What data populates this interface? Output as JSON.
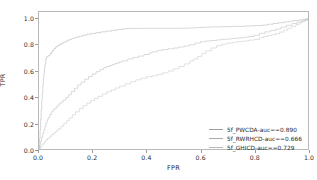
{
  "chart_data": {
    "type": "line",
    "title": "",
    "xlabel": "FPR",
    "ylabel": "TPR",
    "xlim": [
      0.0,
      1.0
    ],
    "ylim": [
      0.0,
      1.05
    ],
    "grid": false,
    "legend_position": "lower right",
    "xticks": [
      "0.0",
      "0.2",
      "0.4",
      "0.6",
      "0.8",
      "1.0"
    ],
    "xtick_values": [
      0.0,
      0.2,
      0.4,
      0.6,
      0.8,
      1.0
    ],
    "yticks": [
      "0.0",
      "0.2",
      "0.4",
      "0.6",
      "0.8",
      "1.0"
    ],
    "ytick_values": [
      0.0,
      0.2,
      0.4,
      0.6,
      0.8,
      1.0
    ],
    "series": [
      {
        "name": "5f_PWCDA-auc==0.890",
        "label": "5f_PWCDA-auc==0.890",
        "auc": 0.89,
        "color": "#9aa0a6",
        "x": [
          0.0,
          0.002,
          0.004,
          0.006,
          0.008,
          0.01,
          0.012,
          0.014,
          0.016,
          0.018,
          0.02,
          0.022,
          0.025,
          0.028,
          0.03,
          0.034,
          0.038,
          0.042,
          0.046,
          0.05,
          0.056,
          0.062,
          0.068,
          0.074,
          0.082,
          0.09,
          0.1,
          0.11,
          0.122,
          0.134,
          0.148,
          0.162,
          0.178,
          0.194,
          0.212,
          0.23,
          0.25,
          0.27,
          0.29,
          0.31,
          0.33,
          0.38,
          0.43,
          0.48,
          0.53,
          0.56,
          0.58,
          0.6,
          0.62,
          0.64,
          0.68,
          0.72,
          0.76,
          0.8,
          0.83,
          0.85,
          0.87,
          0.89,
          0.91,
          0.93,
          0.945,
          0.96,
          0.972,
          0.982,
          0.99,
          0.996,
          1.0
        ],
        "y": [
          0.01,
          0.08,
          0.15,
          0.23,
          0.3,
          0.37,
          0.43,
          0.49,
          0.54,
          0.58,
          0.62,
          0.65,
          0.69,
          0.705,
          0.71,
          0.714,
          0.72,
          0.73,
          0.742,
          0.755,
          0.77,
          0.782,
          0.792,
          0.8,
          0.81,
          0.818,
          0.828,
          0.838,
          0.848,
          0.856,
          0.864,
          0.872,
          0.88,
          0.886,
          0.892,
          0.898,
          0.904,
          0.91,
          0.916,
          0.921,
          0.924,
          0.925,
          0.925,
          0.925,
          0.926,
          0.928,
          0.93,
          0.932,
          0.934,
          0.936,
          0.938,
          0.94,
          0.943,
          0.946,
          0.95,
          0.956,
          0.962,
          0.968,
          0.974,
          0.98,
          0.984,
          0.988,
          0.991,
          0.994,
          0.996,
          0.998,
          1.0
        ]
      },
      {
        "name": "5f_RWRHCD-auc==0.666",
        "label": "5f_RWRHCD-auc==0.666",
        "auc": 0.666,
        "color": "#a8acb1",
        "x": [
          0.0,
          0.003,
          0.006,
          0.01,
          0.014,
          0.018,
          0.022,
          0.026,
          0.03,
          0.034,
          0.04,
          0.046,
          0.052,
          0.058,
          0.066,
          0.074,
          0.082,
          0.09,
          0.1,
          0.11,
          0.12,
          0.132,
          0.144,
          0.156,
          0.17,
          0.184,
          0.198,
          0.212,
          0.226,
          0.24,
          0.25,
          0.262,
          0.272,
          0.282,
          0.29,
          0.3,
          0.31,
          0.33,
          0.35,
          0.37,
          0.39,
          0.41,
          0.42,
          0.44,
          0.46,
          0.48,
          0.5,
          0.52,
          0.54,
          0.56,
          0.58,
          0.6,
          0.62,
          0.64,
          0.66,
          0.68,
          0.7,
          0.72,
          0.74,
          0.76,
          0.78,
          0.8,
          0.82,
          0.84,
          0.86,
          0.88,
          0.9,
          0.92,
          0.94,
          0.96,
          0.975,
          0.985,
          0.992,
          1.0
        ],
        "y": [
          0.005,
          0.03,
          0.06,
          0.09,
          0.12,
          0.15,
          0.175,
          0.2,
          0.222,
          0.24,
          0.265,
          0.285,
          0.3,
          0.312,
          0.33,
          0.346,
          0.36,
          0.375,
          0.395,
          0.415,
          0.44,
          0.465,
          0.49,
          0.512,
          0.535,
          0.555,
          0.575,
          0.592,
          0.608,
          0.622,
          0.632,
          0.64,
          0.648,
          0.655,
          0.66,
          0.668,
          0.676,
          0.69,
          0.702,
          0.712,
          0.724,
          0.736,
          0.745,
          0.756,
          0.762,
          0.768,
          0.774,
          0.782,
          0.79,
          0.8,
          0.812,
          0.822,
          0.828,
          0.832,
          0.836,
          0.84,
          0.844,
          0.848,
          0.852,
          0.856,
          0.862,
          0.872,
          0.886,
          0.898,
          0.908,
          0.92,
          0.934,
          0.948,
          0.962,
          0.974,
          0.982,
          0.988,
          0.993,
          1.0
        ]
      },
      {
        "name": "5f_GHICD-auc==0.729",
        "label": "5f_GHICD-auc==0.729",
        "auc": 0.729,
        "color": "#b5b9bd",
        "x": [
          0.0,
          0.004,
          0.008,
          0.014,
          0.02,
          0.026,
          0.032,
          0.04,
          0.048,
          0.056,
          0.064,
          0.072,
          0.082,
          0.092,
          0.102,
          0.112,
          0.124,
          0.136,
          0.15,
          0.164,
          0.178,
          0.192,
          0.206,
          0.22,
          0.236,
          0.252,
          0.268,
          0.284,
          0.3,
          0.32,
          0.34,
          0.36,
          0.38,
          0.4,
          0.42,
          0.44,
          0.46,
          0.48,
          0.5,
          0.52,
          0.54,
          0.56,
          0.575,
          0.59,
          0.605,
          0.62,
          0.64,
          0.66,
          0.68,
          0.7,
          0.72,
          0.74,
          0.76,
          0.78,
          0.8,
          0.82,
          0.835,
          0.85,
          0.865,
          0.88,
          0.895,
          0.91,
          0.925,
          0.94,
          0.955,
          0.968,
          0.978,
          0.988,
          1.0
        ],
        "y": [
          0.0,
          0.01,
          0.022,
          0.04,
          0.055,
          0.07,
          0.082,
          0.098,
          0.112,
          0.126,
          0.14,
          0.155,
          0.175,
          0.195,
          0.215,
          0.238,
          0.262,
          0.285,
          0.31,
          0.332,
          0.352,
          0.37,
          0.388,
          0.404,
          0.422,
          0.438,
          0.452,
          0.468,
          0.482,
          0.5,
          0.516,
          0.53,
          0.542,
          0.554,
          0.562,
          0.572,
          0.584,
          0.598,
          0.614,
          0.632,
          0.652,
          0.674,
          0.69,
          0.71,
          0.732,
          0.752,
          0.774,
          0.792,
          0.804,
          0.812,
          0.818,
          0.824,
          0.828,
          0.834,
          0.84,
          0.852,
          0.862,
          0.87,
          0.876,
          0.884,
          0.896,
          0.91,
          0.926,
          0.94,
          0.954,
          0.966,
          0.976,
          0.986,
          0.996
        ]
      }
    ]
  },
  "legend": {
    "entries": [
      {
        "label": "5f_PWCDA-auc==0.890",
        "color": "#9aa0a6"
      },
      {
        "label": "5f_RWRHCD-auc==0.666",
        "color": "#a8acb1"
      },
      {
        "label": "5f_GHICD-auc==0.729",
        "color": "#b5b9bd"
      }
    ]
  },
  "colors": {
    "background": "#ffffff",
    "frame": "#b9b9b9",
    "tick": "#9a9a9a",
    "text": "#2b2b2b"
  }
}
